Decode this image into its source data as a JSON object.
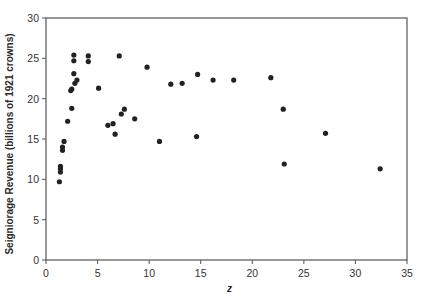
{
  "chart_data": {
    "type": "scatter",
    "title": "",
    "xlabel": "z",
    "ylabel": "Seigniorage Revenue (billions of 1921 crowns)",
    "xlim": [
      0,
      35
    ],
    "ylim": [
      0,
      30
    ],
    "xticks": [
      0,
      5,
      10,
      15,
      20,
      25,
      30,
      35
    ],
    "yticks": [
      0,
      5,
      10,
      15,
      20,
      25,
      30
    ],
    "grid": false,
    "legend": "none",
    "marker_color": "#222222",
    "series": [
      {
        "name": "seigniorage",
        "points": [
          [
            1.3,
            9.7
          ],
          [
            1.4,
            10.9
          ],
          [
            1.4,
            11.3
          ],
          [
            1.4,
            11.6
          ],
          [
            1.6,
            13.6
          ],
          [
            1.6,
            14.0
          ],
          [
            1.75,
            14.7
          ],
          [
            2.1,
            17.2
          ],
          [
            2.5,
            18.8
          ],
          [
            2.4,
            21.0
          ],
          [
            2.5,
            21.2
          ],
          [
            2.8,
            21.9
          ],
          [
            3.0,
            22.3
          ],
          [
            2.7,
            23.1
          ],
          [
            2.7,
            24.7
          ],
          [
            2.7,
            25.4
          ],
          [
            4.1,
            24.6
          ],
          [
            4.1,
            25.3
          ],
          [
            5.1,
            21.3
          ],
          [
            6.0,
            16.7
          ],
          [
            6.5,
            16.9
          ],
          [
            6.7,
            15.6
          ],
          [
            7.1,
            25.3
          ],
          [
            7.3,
            18.1
          ],
          [
            7.6,
            18.7
          ],
          [
            8.6,
            17.5
          ],
          [
            9.8,
            23.9
          ],
          [
            11.0,
            14.7
          ],
          [
            12.1,
            21.8
          ],
          [
            13.2,
            21.9
          ],
          [
            14.6,
            15.3
          ],
          [
            14.7,
            23.0
          ],
          [
            16.2,
            22.3
          ],
          [
            18.2,
            22.3
          ],
          [
            21.8,
            22.6
          ],
          [
            23.0,
            18.7
          ],
          [
            23.1,
            11.9
          ],
          [
            27.1,
            15.7
          ],
          [
            32.4,
            11.3
          ]
        ]
      }
    ]
  }
}
